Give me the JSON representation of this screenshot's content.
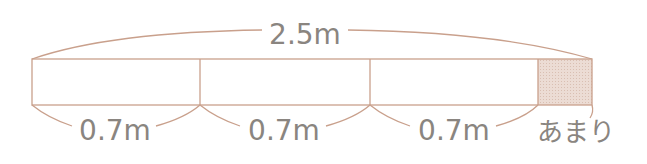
{
  "diagram": {
    "total_label": "2.5m",
    "segments": [
      {
        "label": "0.7m"
      },
      {
        "label": "0.7m"
      },
      {
        "label": "0.7m"
      }
    ],
    "remainder_label": "あまり",
    "colors": {
      "line": "#c9a08c",
      "remainder_fill": "#ecdcd4",
      "text": "#8a8580"
    }
  }
}
